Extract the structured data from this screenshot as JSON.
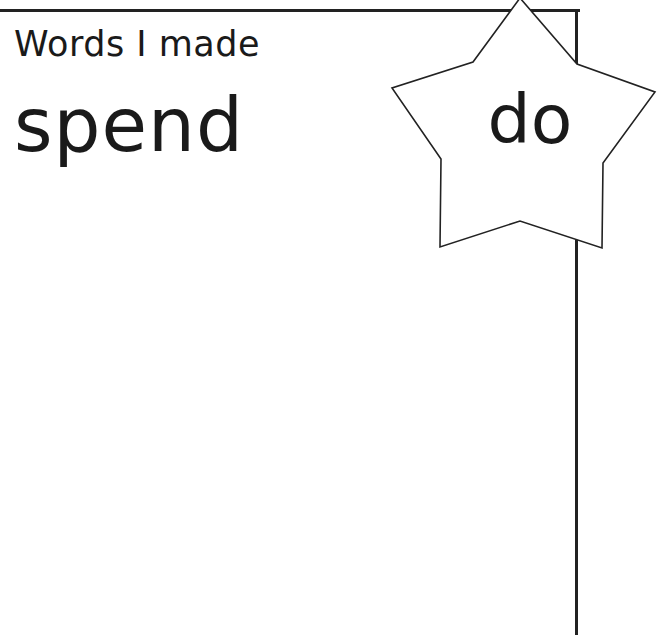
{
  "card": {
    "heading": "Words I made",
    "made_word": "spend",
    "star_word": "do"
  },
  "colors": {
    "line": "#222222",
    "text": "#1a1a1a",
    "background": "#ffffff"
  }
}
